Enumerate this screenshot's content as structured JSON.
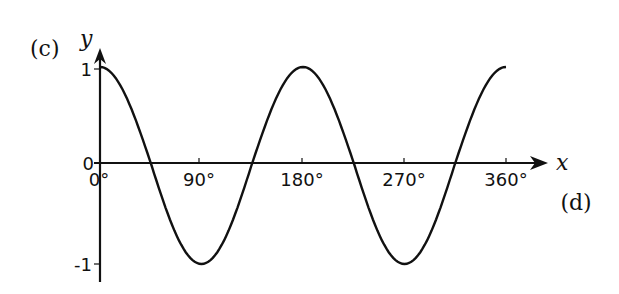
{
  "labels": {
    "part_c": "(c)",
    "part_d": "(d)",
    "y_axis": "y",
    "x_axis": "x"
  },
  "y_ticks": [
    {
      "value": 1,
      "label": "1"
    },
    {
      "value": 0,
      "label": "0"
    },
    {
      "value": -1,
      "label": "-1"
    }
  ],
  "x_ticks": [
    {
      "value": 0,
      "label": "0°"
    },
    {
      "value": 90,
      "label": "90°"
    },
    {
      "value": 180,
      "label": "180°"
    },
    {
      "value": 270,
      "label": "270°"
    },
    {
      "value": 360,
      "label": "360°"
    }
  ],
  "colors": {
    "line": "#111111",
    "background": "#ffffff"
  },
  "chart_data": {
    "type": "line",
    "title": "",
    "function": "y = cos(2x)",
    "xlabel": "x",
    "ylabel": "y",
    "xlim": [
      0,
      360
    ],
    "ylim": [
      -1,
      1
    ],
    "grid": false,
    "x_tick_labels": [
      "0°",
      "90°",
      "180°",
      "270°",
      "360°"
    ],
    "y_tick_labels": [
      "1",
      "0",
      "-1"
    ],
    "annotations": [
      "(c)",
      "(d)"
    ],
    "x": [
      0,
      45,
      90,
      135,
      180,
      225,
      270,
      315,
      360
    ],
    "series": [
      {
        "name": "y = cos 2x",
        "values": [
          1,
          0,
          -1,
          0,
          1,
          0,
          -1,
          0,
          1
        ]
      }
    ]
  }
}
